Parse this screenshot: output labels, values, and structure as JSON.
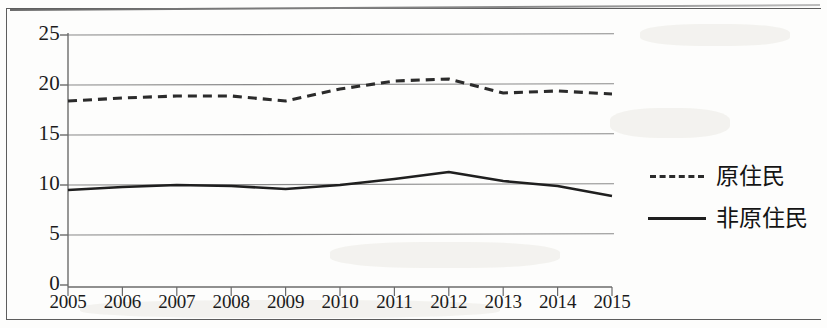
{
  "chart_data": {
    "type": "line",
    "title": "",
    "subtitle": "",
    "xlabel": "",
    "ylabel": "",
    "categories": [
      "2005",
      "2006",
      "2007",
      "2008",
      "2009",
      "2010",
      "2011",
      "2012",
      "2013",
      "2014",
      "2015"
    ],
    "x": [
      2005,
      2006,
      2007,
      2008,
      2009,
      2010,
      2011,
      2012,
      2013,
      2014,
      2015
    ],
    "xlim": [
      2005,
      2015
    ],
    "ylim": [
      0,
      25
    ],
    "yticks": [
      0,
      5,
      10,
      15,
      20,
      25
    ],
    "ytick_labels": [
      "0",
      "5",
      "10",
      "15",
      "20",
      "25"
    ],
    "grid": "horizontal",
    "legend_position": "right",
    "series": [
      {
        "name": "原住民",
        "style": "dashed",
        "color": "#2b2b2b",
        "values": [
          18.4,
          18.7,
          18.9,
          18.9,
          18.4,
          19.6,
          20.4,
          20.6,
          19.2,
          19.4,
          19.1
        ]
      },
      {
        "name": "非原住民",
        "style": "solid",
        "color": "#1f1f1f",
        "values": [
          9.5,
          9.8,
          10.0,
          9.9,
          9.6,
          10.0,
          10.6,
          11.3,
          10.4,
          9.9,
          8.9
        ]
      }
    ]
  },
  "legend": {
    "items": [
      {
        "label": "原住民",
        "style": "dashed"
      },
      {
        "label": "非原住民",
        "style": "solid"
      }
    ]
  },
  "colors": {
    "axis": "#6b6b6b",
    "gridline": "#8a8a8a",
    "series_dashed": "#2b2b2b",
    "series_solid": "#1f1f1f",
    "text": "#1b1b1b",
    "background": "#fdfdfc"
  }
}
